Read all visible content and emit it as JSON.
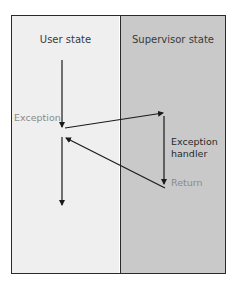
{
  "diagram": {
    "panels": [
      {
        "id": "user",
        "title": "User state",
        "background": "#efefef"
      },
      {
        "id": "supervisor",
        "title": "Supervisor state",
        "background": "#c9c9c9"
      }
    ],
    "labels": {
      "exception": "Exception",
      "handler": "Exception\nhandler",
      "handler_line1": "Exception",
      "handler_line2": "handler",
      "return": "Return"
    },
    "label_colors": {
      "exception": "#8a8a8a",
      "handler": "#2a2a2a",
      "return": "#8a8a8a"
    },
    "arrows": [
      {
        "name": "user-flow-before",
        "from": "user state top",
        "to": "exception point",
        "direction": "down"
      },
      {
        "name": "exception-transfer",
        "from": "user state (exception)",
        "to": "supervisor state",
        "direction": "right-up"
      },
      {
        "name": "handler-flow",
        "from": "handler start",
        "to": "return point",
        "direction": "down"
      },
      {
        "name": "return-transfer",
        "from": "supervisor state (return)",
        "to": "user state",
        "direction": "left-up"
      },
      {
        "name": "user-flow-after",
        "from": "resume point",
        "to": "user state bottom",
        "direction": "down"
      }
    ]
  }
}
